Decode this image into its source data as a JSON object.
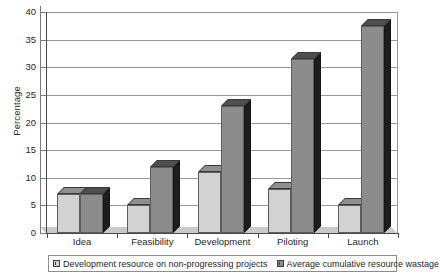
{
  "chart_data": {
    "type": "bar",
    "title": "",
    "subtitle": "",
    "xlabel": "",
    "ylabel": "Percentage",
    "ylim": [
      0,
      40
    ],
    "ytick_step": 5,
    "yticks": [
      40,
      35,
      30,
      25,
      20,
      15,
      10,
      5,
      0
    ],
    "grid": true,
    "grid_axis": "y",
    "legend_position": "bottom",
    "style": "3d-grouped-bar-grayscale",
    "categories": [
      "Idea",
      "Feasibility",
      "Development",
      "Piloting",
      "Launch"
    ],
    "series": [
      {
        "name": "Development resource on non-progressing projects",
        "color": "#d2d2d2",
        "values": [
          7,
          5,
          11,
          8,
          5
        ]
      },
      {
        "name": "Average cumulative resource wastage",
        "color": "#8c8c8c",
        "values": [
          7,
          12,
          23,
          31.5,
          37.5
        ]
      }
    ]
  },
  "axis": {
    "y_title": "Percentage"
  },
  "legend": {
    "items": [
      {
        "label": "Development resource on non-progressing projects",
        "marker": "legend-swatch-series-a"
      },
      {
        "label": "Average cumulative resource wastage",
        "marker": "legend-swatch-series-b"
      }
    ]
  }
}
